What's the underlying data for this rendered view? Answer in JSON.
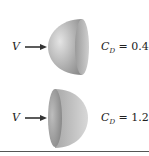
{
  "figure": {
    "top": {
      "flow_label": "V",
      "shape": "hemisphere-convex-facing-flow",
      "coefficient_symbol": "C",
      "coefficient_subscript": "D",
      "coefficient_value": "= 0.4"
    },
    "bottom": {
      "flow_label": "V",
      "shape": "hemisphere-concave-facing-flow",
      "coefficient_symbol": "C",
      "coefficient_subscript": "D",
      "coefficient_value": "= 1.2"
    },
    "colors": {
      "shape_light": "#d6d6d6",
      "shape_dark": "#8f8f8f",
      "arrow": "#333333",
      "rule": "#555555"
    }
  }
}
